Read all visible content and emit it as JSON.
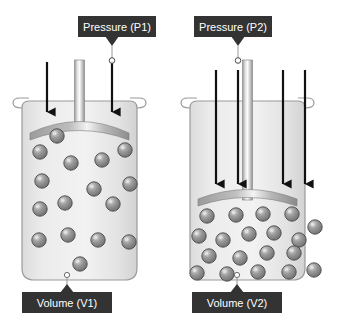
{
  "figure": {
    "background_color": "#ffffff",
    "callout_box_color": "#333333",
    "callout_text_color": "#ffffff",
    "container_fill": "#e8e8e8",
    "container_stroke": "#8a8a8a",
    "piston_color": "#8f8f8f",
    "molecule_fill": "#8d8d8d",
    "molecule_stroke": "#4a4a4a",
    "arrow_color": "#000000"
  },
  "panels": [
    {
      "id": "left",
      "name": "low-pressure-large-volume",
      "pressure_label": "Pressure (P1)",
      "volume_label": "Volume (V1)",
      "arrow_count": 2,
      "molecule_count": 16,
      "piston_y": 124,
      "description": "Lower pressure, larger volume"
    },
    {
      "id": "right",
      "name": "high-pressure-small-volume",
      "pressure_label": "Pressure (P2)",
      "volume_label": "Volume (V2)",
      "arrow_count": 4,
      "molecule_count": 18,
      "piston_y": 196,
      "description": "Higher pressure, smaller volume"
    }
  ],
  "left_molecules": [
    {
      "x": 40,
      "y": 152
    },
    {
      "x": 71,
      "y": 163
    },
    {
      "x": 102,
      "y": 160
    },
    {
      "x": 125,
      "y": 150
    },
    {
      "x": 42,
      "y": 181
    },
    {
      "x": 94,
      "y": 189
    },
    {
      "x": 130,
      "y": 184
    },
    {
      "x": 40,
      "y": 209
    },
    {
      "x": 65,
      "y": 203
    },
    {
      "x": 113,
      "y": 204
    },
    {
      "x": 39,
      "y": 240
    },
    {
      "x": 68,
      "y": 235
    },
    {
      "x": 98,
      "y": 240
    },
    {
      "x": 129,
      "y": 242
    },
    {
      "x": 80,
      "y": 264
    },
    {
      "x": 57,
      "y": 136
    }
  ],
  "right_molecules": [
    {
      "x": 207,
      "y": 216
    },
    {
      "x": 236,
      "y": 215
    },
    {
      "x": 263,
      "y": 214
    },
    {
      "x": 292,
      "y": 214
    },
    {
      "x": 199,
      "y": 236
    },
    {
      "x": 223,
      "y": 240
    },
    {
      "x": 249,
      "y": 234
    },
    {
      "x": 274,
      "y": 233
    },
    {
      "x": 299,
      "y": 240
    },
    {
      "x": 315,
      "y": 227
    },
    {
      "x": 209,
      "y": 256
    },
    {
      "x": 240,
      "y": 258
    },
    {
      "x": 267,
      "y": 253
    },
    {
      "x": 294,
      "y": 253
    },
    {
      "x": 197,
      "y": 273
    },
    {
      "x": 227,
      "y": 274
    },
    {
      "x": 258,
      "y": 272
    },
    {
      "x": 289,
      "y": 272
    },
    {
      "x": 314,
      "y": 270
    }
  ],
  "left_arrows": [
    {
      "x": 47,
      "y1": 62,
      "y2": 120
    },
    {
      "x": 112,
      "y1": 62,
      "y2": 120
    }
  ],
  "right_arrows": [
    {
      "x": 216,
      "y1": 70,
      "y2": 192
    },
    {
      "x": 238,
      "y1": 70,
      "y2": 192
    },
    {
      "x": 283,
      "y1": 70,
      "y2": 192
    },
    {
      "x": 305,
      "y1": 70,
      "y2": 192
    }
  ],
  "callouts": {
    "pressure_left": {
      "label": "Pressure (P1)",
      "box_x": 78,
      "box_y": 16,
      "box_w": 78,
      "box_h": 20
    },
    "pressure_right": {
      "label": "Pressure (P2)",
      "box_x": 194,
      "box_y": 16,
      "box_w": 78,
      "box_h": 20
    },
    "volume_left": {
      "label": "Volume (V1)",
      "box_x": 22,
      "box_y": 293,
      "box_w": 90,
      "box_h": 20
    },
    "volume_right": {
      "label": "Volume (V2)",
      "box_x": 192,
      "box_y": 293,
      "box_w": 90,
      "box_h": 20
    }
  }
}
